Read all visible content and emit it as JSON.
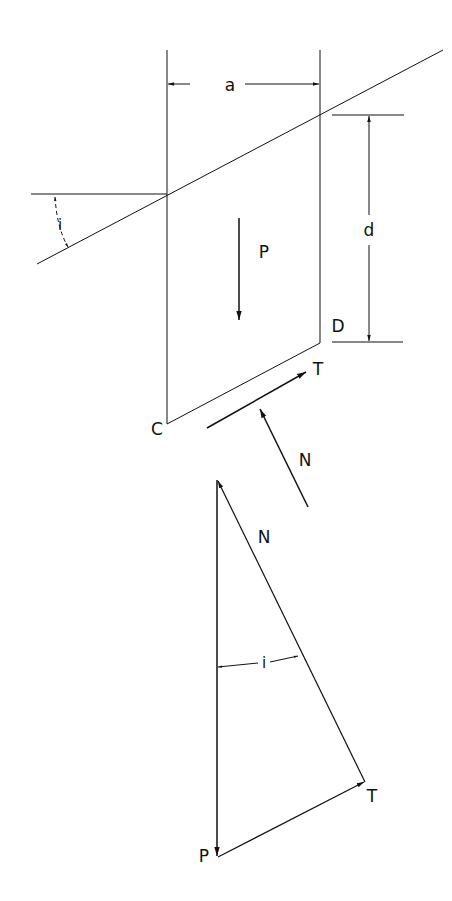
{
  "labels": {
    "a": "a",
    "d": "d",
    "i_slope": "i",
    "P_block": "P",
    "D": "D",
    "T_block": "T",
    "C": "C",
    "N_block": "N",
    "N_triangle": "N",
    "i_triangle": "i",
    "T_triangle": "T",
    "P_triangle": "P"
  },
  "colors": {
    "line": "#111111",
    "background": "#ffffff"
  }
}
